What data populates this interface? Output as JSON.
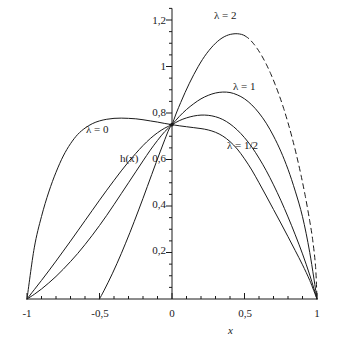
{
  "chart_data": {
    "type": "line",
    "title": "",
    "xlabel": "x",
    "ylabel": "h(x)",
    "xlim": [
      -1,
      1
    ],
    "ylim": [
      0,
      1.25
    ],
    "grid": false,
    "legend_position": "inline-annotations",
    "x_ticks": [
      {
        "value": -1,
        "label": "-1"
      },
      {
        "value": -0.5,
        "label": "-0,5"
      },
      {
        "value": 0,
        "label": "0"
      },
      {
        "value": 0.5,
        "label": "0,5"
      },
      {
        "value": 1,
        "label": "1"
      }
    ],
    "y_ticks": [
      {
        "value": 0.2,
        "label": "0,2"
      },
      {
        "value": 0.4,
        "label": "0,4"
      },
      {
        "value": 0.6,
        "label": "0,6"
      },
      {
        "value": 0.8,
        "label": "0,8"
      },
      {
        "value": 1.0,
        "label": "1"
      },
      {
        "value": 1.2,
        "label": "1,2"
      }
    ],
    "x_minor_tick_step": 0.1,
    "y_minor_tick_step": 0.05,
    "common_point": {
      "x": 0,
      "y": 0.75
    },
    "series": [
      {
        "name": "lambda-0",
        "label": "λ = 0",
        "style": "solid",
        "label_x": -0.55,
        "label_y": 0.685,
        "points": [
          [
            -1,
            0.0
          ],
          [
            -0.95,
            0.22
          ],
          [
            -0.9,
            0.355
          ],
          [
            -0.85,
            0.46
          ],
          [
            -0.8,
            0.545
          ],
          [
            -0.75,
            0.615
          ],
          [
            -0.7,
            0.668
          ],
          [
            -0.65,
            0.708
          ],
          [
            -0.6,
            0.735
          ],
          [
            -0.55,
            0.754
          ],
          [
            -0.5,
            0.766
          ],
          [
            -0.45,
            0.773
          ],
          [
            -0.4,
            0.777
          ],
          [
            -0.35,
            0.778
          ],
          [
            -0.3,
            0.777
          ],
          [
            -0.25,
            0.775
          ],
          [
            -0.2,
            0.771
          ],
          [
            -0.15,
            0.766
          ],
          [
            -0.1,
            0.761
          ],
          [
            -0.05,
            0.755
          ],
          [
            0,
            0.75
          ],
          [
            0.05,
            0.745
          ],
          [
            0.1,
            0.741
          ],
          [
            0.15,
            0.737
          ],
          [
            0.2,
            0.733
          ],
          [
            0.25,
            0.727
          ],
          [
            0.3,
            0.717
          ],
          [
            0.35,
            0.701
          ],
          [
            0.4,
            0.677
          ],
          [
            0.45,
            0.645
          ],
          [
            0.5,
            0.603
          ],
          [
            0.55,
            0.555
          ],
          [
            0.6,
            0.5
          ],
          [
            0.65,
            0.443
          ],
          [
            0.7,
            0.385
          ],
          [
            0.75,
            0.327
          ],
          [
            0.8,
            0.268
          ],
          [
            0.85,
            0.208
          ],
          [
            0.9,
            0.147
          ],
          [
            0.95,
            0.08
          ],
          [
            1,
            0.0
          ]
        ]
      },
      {
        "name": "lambda-one-half",
        "label": "λ = 1/2",
        "style": "solid",
        "label_x": 0.33,
        "label_y": 0.645,
        "points": [
          [
            -1,
            0.0
          ],
          [
            -0.95,
            0.04
          ],
          [
            -0.9,
            0.08
          ],
          [
            -0.85,
            0.121
          ],
          [
            -0.8,
            0.163
          ],
          [
            -0.75,
            0.206
          ],
          [
            -0.7,
            0.249
          ],
          [
            -0.65,
            0.293
          ],
          [
            -0.6,
            0.337
          ],
          [
            -0.55,
            0.381
          ],
          [
            -0.5,
            0.425
          ],
          [
            -0.45,
            0.468
          ],
          [
            -0.4,
            0.51
          ],
          [
            -0.35,
            0.551
          ],
          [
            -0.3,
            0.59
          ],
          [
            -0.25,
            0.626
          ],
          [
            -0.2,
            0.66
          ],
          [
            -0.15,
            0.69
          ],
          [
            -0.1,
            0.715
          ],
          [
            -0.05,
            0.735
          ],
          [
            0,
            0.75
          ],
          [
            0.05,
            0.767
          ],
          [
            0.1,
            0.779
          ],
          [
            0.15,
            0.787
          ],
          [
            0.2,
            0.791
          ],
          [
            0.25,
            0.79
          ],
          [
            0.3,
            0.784
          ],
          [
            0.35,
            0.772
          ],
          [
            0.4,
            0.753
          ],
          [
            0.45,
            0.727
          ],
          [
            0.5,
            0.694
          ],
          [
            0.55,
            0.654
          ],
          [
            0.6,
            0.606
          ],
          [
            0.65,
            0.552
          ],
          [
            0.7,
            0.491
          ],
          [
            0.75,
            0.425
          ],
          [
            0.8,
            0.353
          ],
          [
            0.85,
            0.276
          ],
          [
            0.9,
            0.194
          ],
          [
            0.95,
            0.103
          ],
          [
            1,
            0.0
          ]
        ]
      },
      {
        "name": "lambda-1",
        "label": "λ = 1",
        "style": "solid",
        "label_x": 0.37,
        "label_y": 0.895,
        "points": [
          [
            -1,
            0.0
          ],
          [
            -0.95,
            0.02
          ],
          [
            -0.9,
            0.043
          ],
          [
            -0.85,
            0.069
          ],
          [
            -0.8,
            0.097
          ],
          [
            -0.75,
            0.128
          ],
          [
            -0.7,
            0.161
          ],
          [
            -0.65,
            0.196
          ],
          [
            -0.6,
            0.234
          ],
          [
            -0.55,
            0.274
          ],
          [
            -0.5,
            0.316
          ],
          [
            -0.45,
            0.36
          ],
          [
            -0.4,
            0.406
          ],
          [
            -0.35,
            0.453
          ],
          [
            -0.3,
            0.5
          ],
          [
            -0.25,
            0.547
          ],
          [
            -0.2,
            0.594
          ],
          [
            -0.15,
            0.64
          ],
          [
            -0.1,
            0.682
          ],
          [
            -0.05,
            0.72
          ],
          [
            0,
            0.75
          ],
          [
            0.05,
            0.785
          ],
          [
            0.1,
            0.815
          ],
          [
            0.15,
            0.84
          ],
          [
            0.2,
            0.861
          ],
          [
            0.25,
            0.876
          ],
          [
            0.3,
            0.886
          ],
          [
            0.35,
            0.89
          ],
          [
            0.4,
            0.888
          ],
          [
            0.45,
            0.878
          ],
          [
            0.5,
            0.861
          ],
          [
            0.55,
            0.835
          ],
          [
            0.6,
            0.8
          ],
          [
            0.65,
            0.756
          ],
          [
            0.7,
            0.701
          ],
          [
            0.75,
            0.636
          ],
          [
            0.8,
            0.558
          ],
          [
            0.85,
            0.464
          ],
          [
            0.9,
            0.354
          ],
          [
            0.95,
            0.2
          ],
          [
            1,
            0.0
          ]
        ]
      },
      {
        "name": "lambda-2-solid",
        "label": "λ = 2",
        "style": "solid",
        "label_x": 0.52,
        "label_y": 1.205,
        "points": [
          [
            -0.5,
            0.0
          ],
          [
            -0.47,
            0.035
          ],
          [
            -0.44,
            0.072
          ],
          [
            -0.41,
            0.111
          ],
          [
            -0.38,
            0.152
          ],
          [
            -0.35,
            0.195
          ],
          [
            -0.32,
            0.24
          ],
          [
            -0.29,
            0.286
          ],
          [
            -0.26,
            0.334
          ],
          [
            -0.23,
            0.383
          ],
          [
            -0.2,
            0.433
          ],
          [
            -0.17,
            0.484
          ],
          [
            -0.14,
            0.535
          ],
          [
            -0.11,
            0.586
          ],
          [
            -0.08,
            0.636
          ],
          [
            -0.05,
            0.685
          ],
          [
            -0.02,
            0.731
          ],
          [
            0,
            0.75
          ],
          [
            0.03,
            0.8
          ],
          [
            0.06,
            0.845
          ],
          [
            0.09,
            0.888
          ],
          [
            0.12,
            0.928
          ],
          [
            0.15,
            0.965
          ],
          [
            0.18,
            0.999
          ],
          [
            0.21,
            1.03
          ],
          [
            0.24,
            1.057
          ],
          [
            0.27,
            1.08
          ],
          [
            0.3,
            1.1
          ],
          [
            0.33,
            1.116
          ],
          [
            0.36,
            1.128
          ],
          [
            0.39,
            1.136
          ],
          [
            0.42,
            1.14
          ],
          [
            0.45,
            1.141
          ],
          [
            0.48,
            1.138
          ],
          [
            0.5,
            1.133
          ]
        ]
      },
      {
        "name": "lambda-2-dashed",
        "label": "",
        "style": "dashed",
        "points": [
          [
            0.5,
            1.133
          ],
          [
            0.53,
            1.12
          ],
          [
            0.56,
            1.1
          ],
          [
            0.59,
            1.075
          ],
          [
            0.62,
            1.045
          ],
          [
            0.65,
            1.01
          ],
          [
            0.68,
            0.97
          ],
          [
            0.71,
            0.925
          ],
          [
            0.74,
            0.875
          ],
          [
            0.77,
            0.82
          ],
          [
            0.8,
            0.758
          ],
          [
            0.83,
            0.69
          ],
          [
            0.86,
            0.615
          ],
          [
            0.89,
            0.532
          ],
          [
            0.92,
            0.44
          ],
          [
            0.95,
            0.335
          ],
          [
            0.97,
            0.255
          ],
          [
            0.99,
            0.14
          ],
          [
            1,
            0.0
          ]
        ]
      }
    ]
  },
  "axes": {
    "x_axis_name": "x-axis",
    "y_axis_name": "y-axis"
  }
}
